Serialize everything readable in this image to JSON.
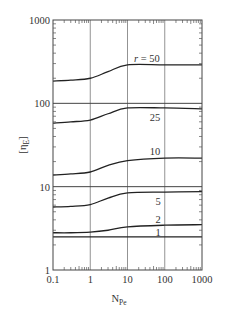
{
  "chart_data": {
    "type": "line",
    "title": "",
    "xlabel": "N_Pe",
    "xlabel_main": "N",
    "xlabel_sub": "Pe",
    "ylabel": "[η_E]",
    "ylabel_main": "[η",
    "ylabel_sub": "E",
    "ylabel_close": "]",
    "xscale": "log",
    "yscale": "log",
    "xlim": [
      0.1,
      1000
    ],
    "ylim": [
      1,
      1000
    ],
    "x_ticks": [
      "0.1",
      "1",
      "10",
      "100",
      "1000"
    ],
    "y_ticks": [
      "1",
      "10",
      "100",
      "1000"
    ],
    "grid": "vertical lines at 1, 10, 100; horizontal reference lines at 100 and 10",
    "legend": "inline curve labels",
    "x": [
      0.1,
      0.3,
      1,
      3,
      10,
      100,
      1000
    ],
    "series": [
      {
        "name": "r = 50",
        "label": "r = 50",
        "values": [
          185,
          190,
          200,
          240,
          290,
          290,
          290
        ]
      },
      {
        "name": "r = 25",
        "label": "25",
        "values": [
          58,
          60,
          63,
          75,
          88,
          88,
          86
        ]
      },
      {
        "name": "r = 10",
        "label": "10",
        "values": [
          13.8,
          14.2,
          15,
          18,
          20.5,
          22,
          22
        ]
      },
      {
        "name": "r = 5",
        "label": "5",
        "values": [
          5.7,
          5.8,
          6.1,
          7.3,
          8.4,
          8.6,
          8.7
        ]
      },
      {
        "name": "r = 2",
        "label": "2",
        "values": [
          2.8,
          2.8,
          2.85,
          3.0,
          3.3,
          3.45,
          3.5
        ]
      },
      {
        "name": "r = 1",
        "label": "1",
        "values": [
          2.5,
          2.5,
          2.5,
          2.5,
          2.5,
          2.5,
          2.5
        ]
      }
    ],
    "reference_lines": [
      100,
      10
    ],
    "annotations": [
      "r = 50",
      "25",
      "10",
      "5",
      "2",
      "1"
    ]
  }
}
